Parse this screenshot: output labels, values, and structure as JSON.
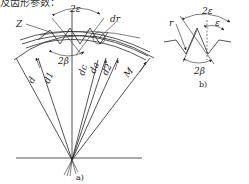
{
  "top_text": "及齿形参数：",
  "figure_a": {
    "caption": "a)",
    "labels": {
      "two_epsilon": "2ε",
      "Z": "Z",
      "d_r": "dr",
      "two_beta": "2β",
      "d": "d",
      "d1": "d1",
      "dc": "dc",
      "da": "da",
      "d2": "d2",
      "M": "M"
    }
  },
  "figure_b": {
    "caption": "b)",
    "labels": {
      "two_epsilon": "2ε",
      "epsilon": "ε",
      "r": "r",
      "two_beta": "2β"
    }
  }
}
